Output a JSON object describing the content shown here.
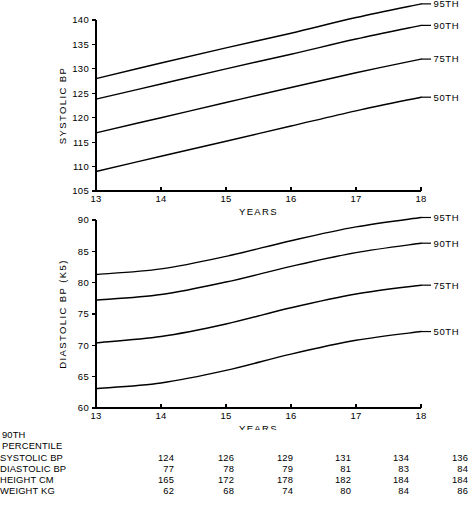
{
  "figure": {
    "background": "#ffffff",
    "ink": "#000000"
  },
  "charts": {
    "systolic": {
      "panel_name": "systolic-bp-chart",
      "ylabel": "SYSTOLIC BP",
      "xlabel": "YEARS",
      "yticks": [
        "105",
        "110",
        "115",
        "120",
        "125",
        "130",
        "135",
        "140"
      ],
      "xticks": [
        "13",
        "14",
        "15",
        "16",
        "17",
        "18"
      ],
      "series_labels": [
        "95TH",
        "90TH",
        "75TH",
        "50TH"
      ]
    },
    "diastolic": {
      "panel_name": "diastolic-bp-chart",
      "ylabel": "DIASTOLIC BP (K5)",
      "xlabel": "YEARS",
      "yticks": [
        "60",
        "65",
        "70",
        "75",
        "80",
        "85",
        "90"
      ],
      "xticks": [
        "13",
        "14",
        "15",
        "16",
        "17",
        "18"
      ],
      "series_labels": [
        "95TH",
        "90TH",
        "75TH",
        "50TH"
      ]
    }
  },
  "table": {
    "title_line1": "90TH",
    "title_line2": "PERCENTILE",
    "row_labels": [
      "SYSTOLIC BP",
      "DIASTOLIC BP",
      "HEIGHT CM",
      "WEIGHT KG"
    ],
    "columns": [
      "13",
      "14",
      "15",
      "16",
      "17",
      "18"
    ],
    "rows": [
      {
        "label": "SYSTOLIC BP",
        "values": [
          "124",
          "126",
          "129",
          "131",
          "134",
          "136"
        ]
      },
      {
        "label": "DIASTOLIC BP",
        "values": [
          "77",
          "78",
          "79",
          "81",
          "83",
          "84"
        ]
      },
      {
        "label": "HEIGHT CM",
        "values": [
          "165",
          "172",
          "178",
          "182",
          "184",
          "184"
        ]
      },
      {
        "label": "WEIGHT KG",
        "values": [
          "62",
          "68",
          "74",
          "80",
          "84",
          "86"
        ]
      }
    ]
  },
  "chart_data": [
    {
      "type": "line",
      "id": "systolic",
      "title": "",
      "xlabel": "YEARS",
      "ylabel": "SYSTOLIC BP",
      "x": [
        13,
        14,
        15,
        16,
        17,
        18
      ],
      "xlim": [
        13,
        18
      ],
      "ylim": [
        105,
        140
      ],
      "yticks": [
        105,
        110,
        115,
        120,
        125,
        130,
        135,
        140
      ],
      "xticks": [
        13,
        14,
        15,
        16,
        17,
        18
      ],
      "grid": false,
      "legend": "right-end-labels",
      "series": [
        {
          "name": "95TH",
          "values": [
            128.0,
            131.2,
            134.3,
            137.3,
            140.5,
            143.3
          ]
        },
        {
          "name": "90TH",
          "values": [
            123.8,
            126.9,
            130.0,
            133.0,
            136.1,
            138.9
          ]
        },
        {
          "name": "75TH",
          "values": [
            116.9,
            120.0,
            123.1,
            126.2,
            129.2,
            132.0
          ]
        },
        {
          "name": "50TH",
          "values": [
            109.0,
            112.1,
            115.2,
            118.3,
            121.4,
            124.2
          ]
        }
      ]
    },
    {
      "type": "line",
      "id": "diastolic",
      "title": "",
      "xlabel": "YEARS",
      "ylabel": "DIASTOLIC BP (K5)",
      "x": [
        13,
        14,
        15,
        16,
        17,
        18
      ],
      "xlim": [
        13,
        18
      ],
      "ylim": [
        60,
        90
      ],
      "yticks": [
        60,
        65,
        70,
        75,
        80,
        85,
        90
      ],
      "xticks": [
        13,
        14,
        15,
        16,
        17,
        18
      ],
      "grid": false,
      "legend": "right-end-labels",
      "series": [
        {
          "name": "95TH",
          "values": [
            81.3,
            82.2,
            84.2,
            86.7,
            88.9,
            90.4
          ]
        },
        {
          "name": "90TH",
          "values": [
            77.2,
            78.1,
            80.1,
            82.6,
            84.8,
            86.3
          ]
        },
        {
          "name": "75TH",
          "values": [
            70.4,
            71.4,
            73.4,
            76.0,
            78.2,
            79.6
          ]
        },
        {
          "name": "50TH",
          "values": [
            63.1,
            64.0,
            66.0,
            68.6,
            70.8,
            72.2
          ]
        }
      ]
    }
  ]
}
